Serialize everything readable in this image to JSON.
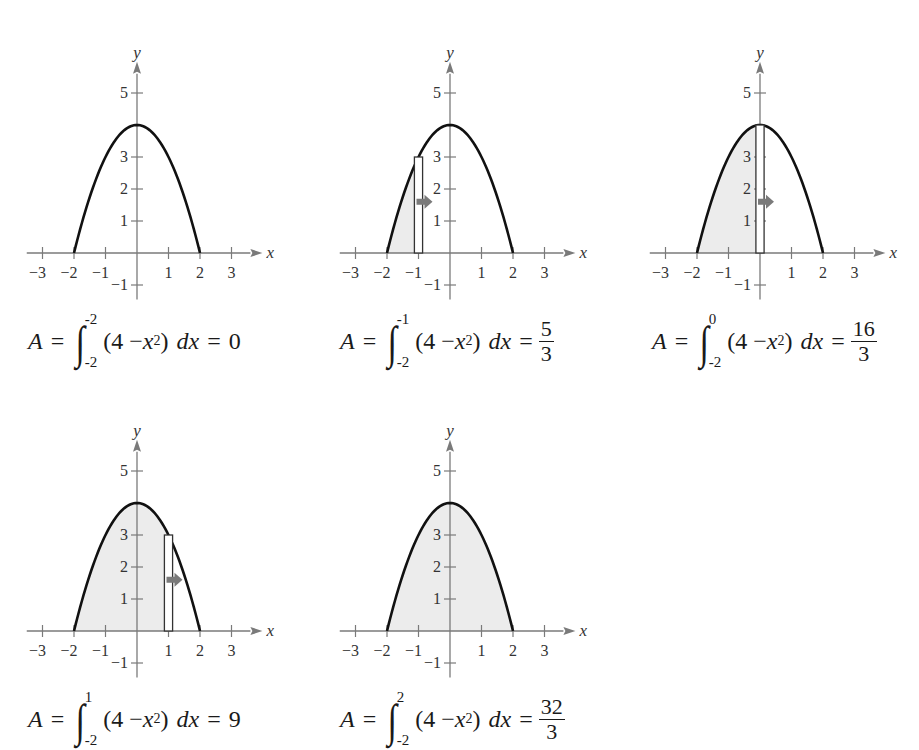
{
  "figure": {
    "function_label": "4 - x^2",
    "axis_x_label": "x",
    "axis_y_label": "y",
    "x_ticks": [
      "-3",
      "-2",
      "-1",
      "1",
      "2",
      "3"
    ],
    "y_ticks": [
      "5",
      "3",
      "2",
      "1",
      "-1"
    ],
    "colors": {
      "curve": "#111111",
      "axis": "#7a7a7a",
      "fill": "#ececec",
      "arrow": "#7a7a7a",
      "rect_stroke": "#333333"
    },
    "panels": [
      {
        "upper": "-2",
        "lower": "-2",
        "result": "0",
        "result_is_fraction": false,
        "shade_to": -2,
        "rect_at": null,
        "formula": {
          "A": "A",
          "eq": "=",
          "integrand_open": "(4 − ",
          "x": "x",
          "sup": "2",
          "integrand_close": ")",
          "dx": "dx",
          "eq2": "=",
          "value": "0"
        }
      },
      {
        "upper": "-1",
        "lower": "-2",
        "result": "5/3",
        "result_is_fraction": true,
        "shade_to": -1,
        "rect_at": -1,
        "formula": {
          "A": "A",
          "eq": "=",
          "integrand_open": "(4 − ",
          "x": "x",
          "sup": "2",
          "integrand_close": ")",
          "dx": "dx",
          "eq2": "=",
          "num": "5",
          "den": "3"
        }
      },
      {
        "upper": "0",
        "lower": "-2",
        "result": "16/3",
        "result_is_fraction": true,
        "shade_to": 0,
        "rect_at": 0,
        "formula": {
          "A": "A",
          "eq": "=",
          "integrand_open": "(4 − ",
          "x": "x",
          "sup": "2",
          "integrand_close": ")",
          "dx": "dx",
          "eq2": "=",
          "num": "16",
          "den": "3"
        }
      },
      {
        "upper": "1",
        "lower": "-2",
        "result": "9",
        "result_is_fraction": false,
        "shade_to": 1,
        "rect_at": 1,
        "formula": {
          "A": "A",
          "eq": "=",
          "integrand_open": "(4 − ",
          "x": "x",
          "sup": "2",
          "integrand_close": ")",
          "dx": "dx",
          "eq2": "=",
          "value": "9"
        }
      },
      {
        "upper": "2",
        "lower": "-2",
        "result": "32/3",
        "result_is_fraction": true,
        "shade_to": 2,
        "rect_at": null,
        "formula": {
          "A": "A",
          "eq": "=",
          "integrand_open": "(4 − ",
          "x": "x",
          "sup": "2",
          "integrand_close": ")",
          "dx": "dx",
          "eq2": "=",
          "num": "32",
          "den": "3"
        }
      }
    ]
  },
  "chart_data": [
    {
      "type": "area",
      "title": "",
      "function": "y = 4 - x^2",
      "xlabel": "x",
      "ylabel": "y",
      "xlim": [
        -3,
        3
      ],
      "ylim": [
        -1,
        5
      ],
      "x_ticks": [
        -3,
        -2,
        -1,
        1,
        2,
        3
      ],
      "y_ticks": [
        -1,
        1,
        2,
        3,
        5
      ],
      "shaded_interval": [
        -2,
        -2
      ],
      "area": 0,
      "annotation": "A = ∫_{-2}^{-2} (4 - x^2) dx = 0"
    },
    {
      "type": "area",
      "title": "",
      "function": "y = 4 - x^2",
      "xlabel": "x",
      "ylabel": "y",
      "xlim": [
        -3,
        3
      ],
      "ylim": [
        -1,
        5
      ],
      "x_ticks": [
        -3,
        -2,
        -1,
        1,
        2,
        3
      ],
      "y_ticks": [
        -1,
        1,
        2,
        3,
        5
      ],
      "shaded_interval": [
        -2,
        -1
      ],
      "area": 1.6667,
      "rectangle_at_x": -1,
      "rectangle_height": 3,
      "annotation": "A = ∫_{-2}^{-1} (4 - x^2) dx = 5/3"
    },
    {
      "type": "area",
      "title": "",
      "function": "y = 4 - x^2",
      "xlabel": "x",
      "ylabel": "y",
      "xlim": [
        -3,
        3
      ],
      "ylim": [
        -1,
        5
      ],
      "x_ticks": [
        -3,
        -2,
        -1,
        1,
        2,
        3
      ],
      "y_ticks": [
        -1,
        1,
        2,
        3,
        5
      ],
      "shaded_interval": [
        -2,
        0
      ],
      "area": 5.3333,
      "rectangle_at_x": 0,
      "rectangle_height": 4,
      "annotation": "A = ∫_{-2}^{0} (4 - x^2) dx = 16/3"
    },
    {
      "type": "area",
      "title": "",
      "function": "y = 4 - x^2",
      "xlabel": "x",
      "ylabel": "y",
      "xlim": [
        -3,
        3
      ],
      "ylim": [
        -1,
        5
      ],
      "x_ticks": [
        -3,
        -2,
        -1,
        1,
        2,
        3
      ],
      "y_ticks": [
        -1,
        1,
        2,
        3,
        5
      ],
      "shaded_interval": [
        -2,
        1
      ],
      "area": 9,
      "rectangle_at_x": 1,
      "rectangle_height": 3,
      "annotation": "A = ∫_{-2}^{1} (4 - x^2) dx = 9"
    },
    {
      "type": "area",
      "title": "",
      "function": "y = 4 - x^2",
      "xlabel": "x",
      "ylabel": "y",
      "xlim": [
        -3,
        3
      ],
      "ylim": [
        -1,
        5
      ],
      "x_ticks": [
        -3,
        -2,
        -1,
        1,
        2,
        3
      ],
      "y_ticks": [
        -1,
        1,
        2,
        3,
        5
      ],
      "shaded_interval": [
        -2,
        2
      ],
      "area": 10.6667,
      "annotation": "A = ∫_{-2}^{2} (4 - x^2) dx = 32/3"
    }
  ]
}
